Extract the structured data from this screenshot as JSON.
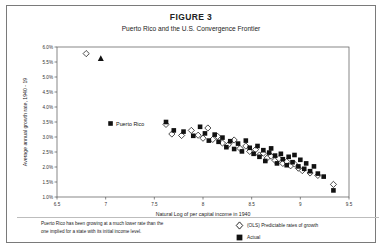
{
  "figure": {
    "number": "FIGURE 3",
    "subtitle": "Puerto Rico and the U.S. Convergence Frontier"
  },
  "footnote": {
    "line1": "Puerto Rico has been growing at a much lower rate than the",
    "line2": "one implied for a state with its initial income level."
  },
  "legend": [
    {
      "label": "(OLS) Predictable rates of growth",
      "marker": "open-diamond"
    },
    {
      "label": "Actual",
      "marker": "filled-square"
    }
  ],
  "annotations": [
    {
      "text": "Puerto Rico",
      "x": 7.05,
      "y": 3.45
    }
  ],
  "chart_data": {
    "type": "scatter",
    "title": "Puerto Rico and the U.S. Convergence Frontier",
    "xlabel": "Natural Log of per capital income in 1940",
    "ylabel": "Average annual growth rate, 1940 - 19",
    "xlim": [
      6.5,
      9.5
    ],
    "ylim": [
      1.0,
      6.0
    ],
    "xticks": [
      "6.5",
      "7",
      "7.5",
      "8",
      "8.5",
      "9",
      "9.5"
    ],
    "xtick_values": [
      6.5,
      7,
      7.5,
      8,
      8.5,
      9,
      9.5
    ],
    "yticks": [
      "1.0%",
      "1.5%",
      "2.0%",
      "2.5%",
      "3.0%",
      "3.5%",
      "4.0%",
      "4.5%",
      "5.0%",
      "5.5%",
      "6.0%"
    ],
    "ytick_values": [
      1.0,
      1.5,
      2.0,
      2.5,
      3.0,
      3.5,
      4.0,
      4.5,
      5.0,
      5.5,
      6.0
    ],
    "grid": false,
    "legend_position": "bottom-right",
    "series": [
      {
        "name": "(OLS) Predictable rates of growth",
        "marker": "open-diamond",
        "points": [
          [
            6.8,
            5.78
          ],
          [
            7.62,
            3.42
          ],
          [
            7.68,
            3.1
          ],
          [
            7.78,
            3.05
          ],
          [
            7.88,
            3.22
          ],
          [
            7.95,
            3.06
          ],
          [
            8.0,
            2.96
          ],
          [
            8.05,
            3.3
          ],
          [
            8.1,
            2.92
          ],
          [
            8.15,
            3.02
          ],
          [
            8.2,
            2.8
          ],
          [
            8.26,
            2.74
          ],
          [
            8.32,
            2.9
          ],
          [
            8.38,
            2.62
          ],
          [
            8.44,
            2.7
          ],
          [
            8.48,
            2.52
          ],
          [
            8.54,
            2.58
          ],
          [
            8.58,
            2.4
          ],
          [
            8.62,
            2.46
          ],
          [
            8.66,
            2.3
          ],
          [
            8.7,
            2.36
          ],
          [
            8.74,
            2.22
          ],
          [
            8.78,
            2.28
          ],
          [
            8.82,
            2.12
          ],
          [
            8.86,
            2.18
          ],
          [
            8.9,
            2.04
          ],
          [
            8.94,
            2.1
          ],
          [
            8.98,
            1.96
          ],
          [
            9.02,
            1.88
          ],
          [
            9.1,
            1.8
          ],
          [
            9.18,
            1.72
          ],
          [
            9.34,
            1.42
          ]
        ]
      },
      {
        "name": "Actual",
        "marker": "filled-square",
        "points": [
          [
            7.05,
            3.45
          ],
          [
            7.62,
            3.5
          ],
          [
            7.7,
            3.22
          ],
          [
            7.8,
            3.18
          ],
          [
            7.9,
            3.04
          ],
          [
            7.97,
            3.34
          ],
          [
            8.02,
            3.12
          ],
          [
            8.06,
            2.88
          ],
          [
            8.12,
            3.08
          ],
          [
            8.16,
            2.84
          ],
          [
            8.2,
            2.98
          ],
          [
            8.24,
            2.66
          ],
          [
            8.28,
            2.86
          ],
          [
            8.32,
            2.6
          ],
          [
            8.36,
            2.78
          ],
          [
            8.4,
            2.52
          ],
          [
            8.44,
            2.88
          ],
          [
            8.48,
            2.64
          ],
          [
            8.52,
            2.44
          ],
          [
            8.56,
            2.7
          ],
          [
            8.58,
            2.34
          ],
          [
            8.62,
            2.56
          ],
          [
            8.64,
            2.2
          ],
          [
            8.68,
            2.48
          ],
          [
            8.7,
            2.62
          ],
          [
            8.74,
            2.38
          ],
          [
            8.76,
            2.12
          ],
          [
            8.8,
            2.44
          ],
          [
            8.82,
            2.26
          ],
          [
            8.86,
            2.06
          ],
          [
            8.88,
            2.34
          ],
          [
            8.92,
            2.16
          ],
          [
            8.94,
            2.4
          ],
          [
            8.98,
            2.02
          ],
          [
            9.0,
            2.24
          ],
          [
            9.04,
            1.94
          ],
          [
            9.06,
            2.12
          ],
          [
            9.1,
            1.86
          ],
          [
            9.14,
            2.02
          ],
          [
            9.18,
            1.78
          ],
          [
            9.24,
            1.68
          ],
          [
            9.34,
            1.22
          ]
        ]
      },
      {
        "name": "Outlier",
        "marker": "filled-triangle",
        "points": [
          [
            6.95,
            5.62
          ]
        ]
      }
    ]
  }
}
